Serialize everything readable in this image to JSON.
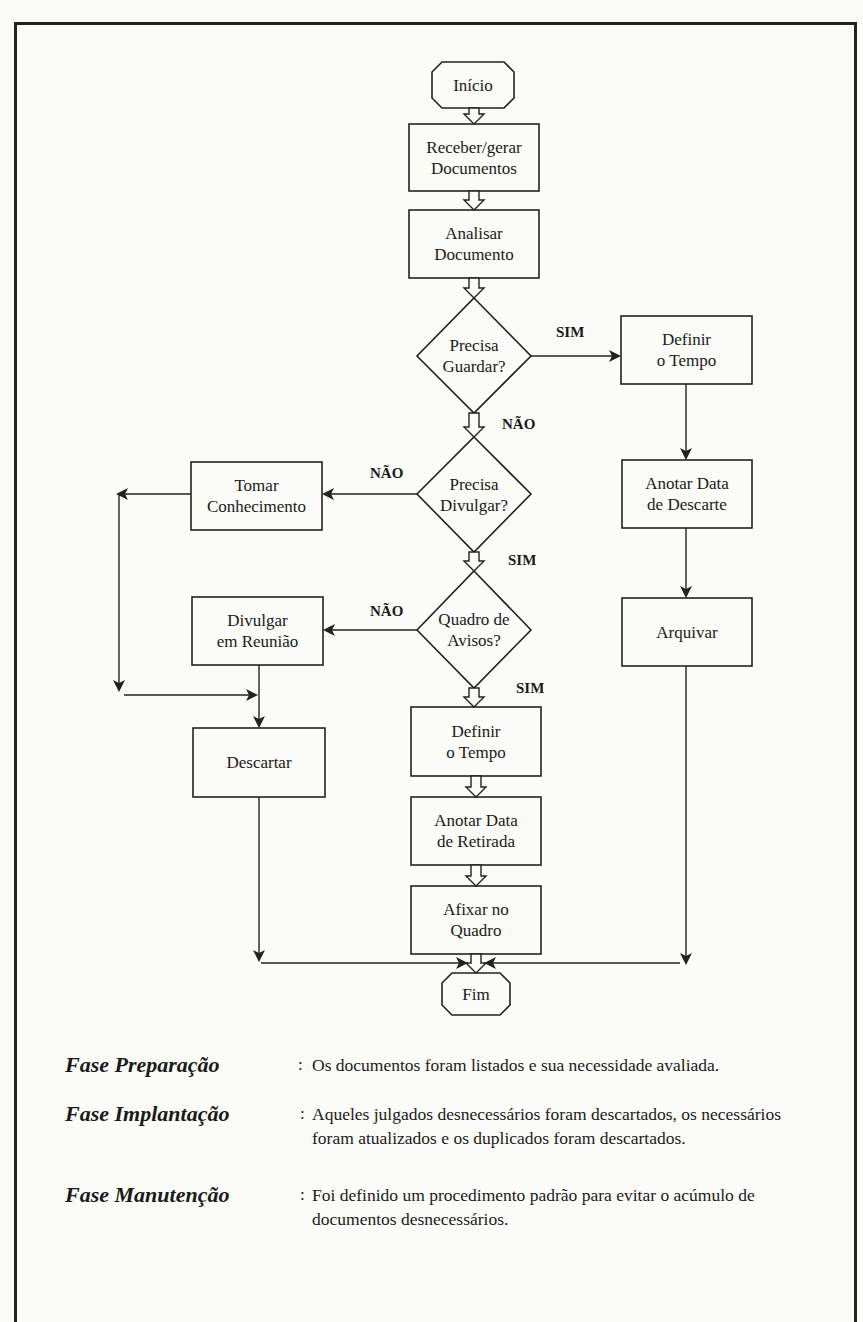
{
  "nodes": {
    "inicio": "Início",
    "receber": "Receber/gerar\nDocumentos",
    "analisar": "Analisar\nDocumento",
    "precisa_guardar": "Precisa\nGuardar?",
    "definir_tempo_right": "Definir\no Tempo",
    "anotar_descarte": "Anotar Data\nde Descarte",
    "arquivar": "Arquivar",
    "precisa_divulgar": "Precisa\nDivulgar?",
    "tomar_conhecimento": "Tomar\nConhecimento",
    "quadro_avisos": "Quadro de\nAvisos?",
    "divulgar_reuniao": "Divulgar\nem Reunião",
    "descartar": "Descartar",
    "definir_tempo_center": "Definir\no Tempo",
    "anotar_retirada": "Anotar Data\nde Retirada",
    "afixar_quadro": "Afixar no\nQuadro",
    "fim": "Fim"
  },
  "edge_labels": {
    "guardar_sim": "SIM",
    "guardar_nao": "NÃO",
    "divulgar_nao": "NÃO",
    "divulgar_sim": "SIM",
    "quadro_nao": "NÃO",
    "quadro_sim": "SIM"
  },
  "legend": [
    {
      "phase": "Fase Preparação",
      "separator": ":",
      "description": "Os documentos foram listados e sua necessidade avaliada."
    },
    {
      "phase": "Fase Implantação",
      "separator": ":",
      "description": "Aqueles julgados desnecessários foram descartados, os necessários foram atualizados e os duplicados foram descartados."
    },
    {
      "phase": "Fase Manutenção",
      "separator": ":",
      "description": "Foi definido um procedimento padrão para evitar o acúmulo de documentos desnecessários."
    }
  ],
  "colors": {
    "background": "#fbfbf8",
    "line": "#222222",
    "text": "#1a1a1a"
  }
}
